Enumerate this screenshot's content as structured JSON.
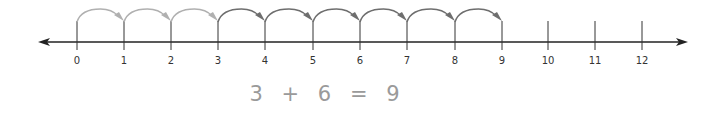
{
  "diagram": {
    "type": "number-line-addition",
    "axis": {
      "min": 0,
      "max": 12,
      "y": 42,
      "x_start": 38,
      "x_end": 688,
      "color": "#222222"
    },
    "ticks": [
      {
        "value": 0,
        "label": "0",
        "x": 77
      },
      {
        "value": 1,
        "label": "1",
        "x": 124
      },
      {
        "value": 2,
        "label": "2",
        "x": 171
      },
      {
        "value": 3,
        "label": "3",
        "x": 218
      },
      {
        "value": 4,
        "label": "4",
        "x": 265
      },
      {
        "value": 5,
        "label": "5",
        "x": 313
      },
      {
        "value": 6,
        "label": "6",
        "x": 360
      },
      {
        "value": 7,
        "label": "7",
        "x": 407
      },
      {
        "value": 8,
        "label": "8",
        "x": 455
      },
      {
        "value": 9,
        "label": "9",
        "x": 502
      },
      {
        "value": 10,
        "label": "10",
        "x": 548
      },
      {
        "value": 11,
        "label": "11",
        "x": 595
      },
      {
        "value": 12,
        "label": "12",
        "x": 642
      }
    ],
    "jumps": [
      {
        "from": 0,
        "to": 1,
        "color": "#b0b0b0",
        "group": "first-addend"
      },
      {
        "from": 1,
        "to": 2,
        "color": "#b0b0b0",
        "group": "first-addend"
      },
      {
        "from": 2,
        "to": 3,
        "color": "#b0b0b0",
        "group": "first-addend"
      },
      {
        "from": 3,
        "to": 4,
        "color": "#6e6e6e",
        "group": "second-addend"
      },
      {
        "from": 4,
        "to": 5,
        "color": "#6e6e6e",
        "group": "second-addend"
      },
      {
        "from": 5,
        "to": 6,
        "color": "#6e6e6e",
        "group": "second-addend"
      },
      {
        "from": 6,
        "to": 7,
        "color": "#6e6e6e",
        "group": "second-addend"
      },
      {
        "from": 7,
        "to": 8,
        "color": "#6e6e6e",
        "group": "second-addend"
      },
      {
        "from": 8,
        "to": 9,
        "color": "#6e6e6e",
        "group": "second-addend"
      }
    ]
  },
  "equation": {
    "addend1": "3",
    "plus": "+",
    "addend2": "6",
    "equals": "=",
    "sum": "9"
  }
}
